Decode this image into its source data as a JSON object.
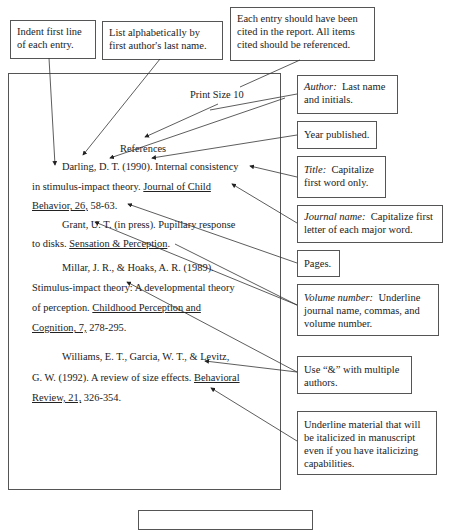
{
  "callouts": {
    "indent": "Indent first line of each entry.",
    "alphabetical": "List alphabetically by first author's last name.",
    "cited": "Each entry should have been cited in the report.  All items cited should be referenced.",
    "author": {
      "label": "Author:",
      "text": "Last name and initials."
    },
    "year": "Year published.",
    "title": {
      "label": "Title:",
      "text": "Capitalize first word only."
    },
    "journal": {
      "label": "Journal name:",
      "text": "Capitalize first letter of each major word."
    },
    "pages": "Pages.",
    "volume": {
      "label": "Volume number:",
      "text": "Underline journal name, commas, and volume number."
    },
    "ampersand": "Use “&” with multiple authors.",
    "underline": "Underline material that will be italicized in manuscript even if you have italicizing capabilities."
  },
  "page": {
    "print_size": "Print Size 10",
    "heading": "References",
    "lines": {
      "l1": "Darling, D. T. (1990).  Internal consistency",
      "l2a": "in stimulus-impact theory.  ",
      "l2b": "Journal of Child",
      "l3a": "Behavior, 26,",
      "l3b": " 58-63.",
      "l4": "Grant, U. T. (in press).  Pupillary response",
      "l5a": "to disks.  ",
      "l5b": "Sensation & Perception",
      "l5c": ".",
      "l6": "Millar, J. R., & Hoaks, A. R. (1989).",
      "l7": "Stimulus-impact theory:  A developmental theory",
      "l8a": "of perception.  ",
      "l8b": "Childhood Perception and",
      "l9a": "Cognition, 7,",
      "l9b": " 278-295.",
      "l10": "Williams, E. T., Garcia, W. T., & Levitz,",
      "l11a": "G. W. (1992).  A review of size effects.  ",
      "l11b": "Behavioral",
      "l12a": "Review, 21,",
      "l12b": " 326-354."
    }
  }
}
